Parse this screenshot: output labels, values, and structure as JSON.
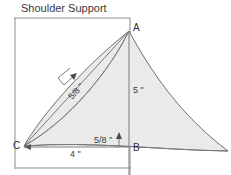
{
  "title": "Shoulder Support",
  "colors": {
    "fill": "#eaeaea",
    "outline": "#6f6f6f",
    "frame": "#8d8d8d",
    "text": "#3a3a3a",
    "background": "#ffffff"
  },
  "points": {
    "a": "A",
    "b": "B",
    "c": "C"
  },
  "dimensions": {
    "diagonal_offset": "5/8 \"",
    "vertical_height": "5 \"",
    "base_rise": "5/8 \"",
    "base_width": "4 \""
  },
  "icons": {
    "arrow_diagonal": "arrow-diagonal-icon",
    "arrow_up": "arrow-up-icon",
    "tick_left": "tick-mark-icon",
    "tick_right": "tick-mark-icon"
  }
}
